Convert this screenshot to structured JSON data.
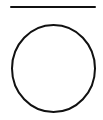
{
  "figure": {
    "background": "#ffffff",
    "stroke_color": "#111111",
    "line": {
      "x1": 11,
      "y1": 7,
      "x2": 95,
      "y2": 7,
      "stroke_width": 2
    },
    "circle": {
      "cx": 53.5,
      "cy": 68.5,
      "rx": 41.5,
      "ry": 43.5,
      "stroke_width": 2
    }
  }
}
